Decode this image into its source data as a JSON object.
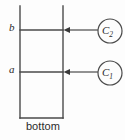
{
  "diagram": {
    "colors": {
      "background": "#fdfdfd",
      "stroke": "#4a4a4a",
      "text": "#2b2b2b"
    },
    "labels": {
      "level_b": "b",
      "level_a": "a",
      "bottom": "bottom"
    },
    "nodes": [
      {
        "id": "c2",
        "symbol": "C",
        "subscript": "2",
        "cx": 110,
        "cy": 31,
        "r": 12
      },
      {
        "id": "c1",
        "symbol": "C",
        "subscript": "1",
        "cx": 110,
        "cy": 73,
        "r": 12
      }
    ],
    "geometry": {
      "left_vertical_x": 20,
      "right_vertical_x": 63,
      "vertical_top_y": 6,
      "vertical_bottom_y": 118,
      "line_b_y": 30,
      "line_a_y": 72,
      "bottom_line_y": 118,
      "arrow_start_x": 98,
      "arrow_end_x": 64
    }
  }
}
